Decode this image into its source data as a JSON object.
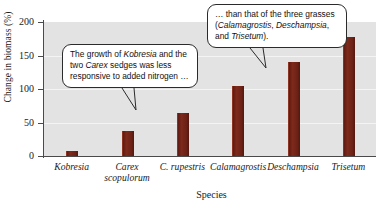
{
  "chart_data": {
    "type": "bar",
    "title": "",
    "xlabel": "Species",
    "ylabel": "Change in biomass (%)",
    "categories": [
      "Kobresia",
      "Carex scopulorum",
      "C. rupestris",
      "Calamagrostis",
      "Deschampsia",
      "Trisetum"
    ],
    "values": [
      7,
      37,
      64,
      105,
      140,
      178
    ],
    "ylim": [
      0,
      200
    ],
    "yticks": [
      0,
      50,
      100,
      150,
      200
    ],
    "grid": true,
    "legend": "none",
    "bar_color": "#6d2217",
    "plot_background": "#e3e3e3"
  },
  "axes": {
    "y_title": "Change in biomass (%)",
    "x_title": "Species",
    "tick_labels": [
      "0",
      "50",
      "100",
      "150",
      "200"
    ]
  },
  "categories": [
    {
      "line1": "Kobresia",
      "line2": ""
    },
    {
      "line1": "Carex",
      "line2": "scopulorum"
    },
    {
      "line1": "C. rupestris",
      "line2": ""
    },
    {
      "line1": "Calamagrostis",
      "line2": ""
    },
    {
      "line1": "Deschampsia",
      "line2": ""
    },
    {
      "line1": "Trisetum",
      "line2": ""
    }
  ],
  "callouts": {
    "left": {
      "part1": "The growth of ",
      "em1": "Kobresia",
      "part2": " and the two ",
      "em2": "Carex",
      "part3": " sedges was less responsive to added nitrogen …"
    },
    "right": {
      "part1": "… than that of the three grasses (",
      "em1": "Calamagrostis",
      "part2": ", ",
      "em2": "Deschampsia",
      "part3": ", and ",
      "em3": "Trisetum",
      "part4": ")."
    }
  }
}
